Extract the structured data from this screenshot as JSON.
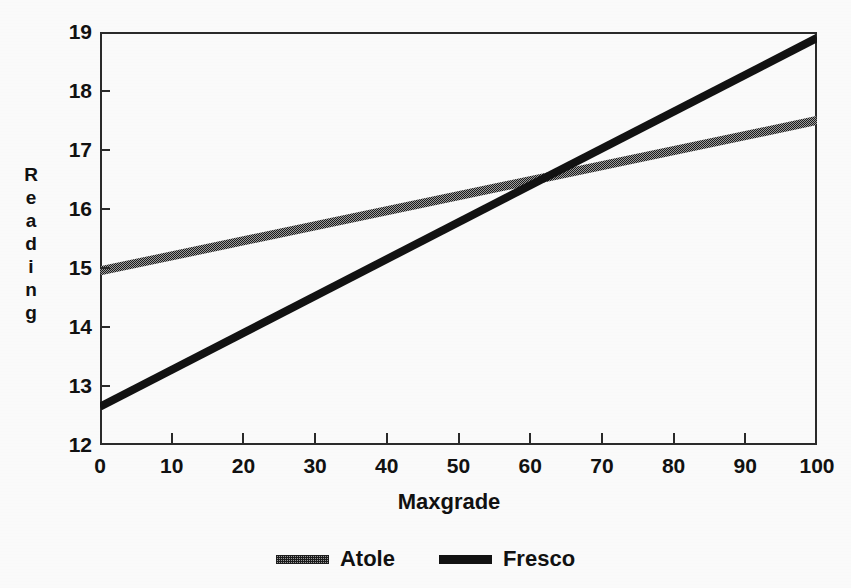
{
  "chart_data": {
    "type": "line",
    "title": "",
    "subtitle": "",
    "xlabel": "Maxgrade",
    "ylabel": "Reading",
    "xlim": [
      0,
      100
    ],
    "ylim": [
      12,
      19
    ],
    "xticks": [
      0,
      10,
      20,
      30,
      40,
      50,
      60,
      70,
      80,
      90,
      100
    ],
    "xtick_labels": [
      "0",
      "10",
      "20",
      "30",
      "40",
      "50",
      "60",
      "70",
      "80",
      "90",
      "100"
    ],
    "yticks": [
      12,
      13,
      14,
      15,
      16,
      17,
      18,
      19
    ],
    "ytick_labels": [
      "12",
      "13",
      "14",
      "15",
      "16",
      "17",
      "18",
      "19"
    ],
    "grid": false,
    "legend_position": "bottom-center",
    "series": [
      {
        "name": "Atole",
        "style": "hatched",
        "color": "#8f8f8f",
        "x": [
          0,
          100
        ],
        "values": [
          14.95,
          17.5
        ]
      },
      {
        "name": "Fresco",
        "style": "solid",
        "color": "#121212",
        "x": [
          0,
          100
        ],
        "values": [
          12.65,
          18.9
        ]
      }
    ],
    "annotations": [
      {
        "label": "lines-intersection",
        "x": 63,
        "y": 16.5
      }
    ]
  },
  "axes": {
    "y_title_letters": [
      "R",
      "e",
      "a",
      "d",
      "i",
      "n",
      "g"
    ]
  },
  "legend": {
    "entries": [
      {
        "label": "Atole"
      },
      {
        "label": "Fresco"
      }
    ]
  }
}
